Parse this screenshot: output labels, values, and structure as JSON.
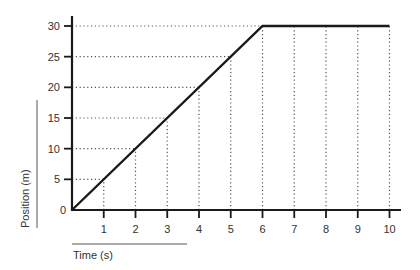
{
  "chart_data": {
    "type": "line",
    "title": "",
    "xlabel": "Time (s)",
    "ylabel": "Position (m)",
    "x_ticks": [
      1,
      2,
      3,
      4,
      5,
      6,
      7,
      8,
      9,
      10
    ],
    "y_ticks": [
      5,
      10,
      15,
      20,
      25,
      30
    ],
    "origin_label": "0",
    "xlim": [
      0,
      10
    ],
    "ylim": [
      0,
      30
    ],
    "grid": "dotted",
    "legend": null,
    "series": [
      {
        "name": "Position",
        "x": [
          0,
          6,
          10
        ],
        "y": [
          0,
          30,
          30
        ]
      }
    ]
  },
  "colors": {
    "line": "#1a1a1a",
    "axis": "#1a1a1a",
    "grid": "#555555",
    "text": "#333333",
    "background": "#ffffff"
  }
}
